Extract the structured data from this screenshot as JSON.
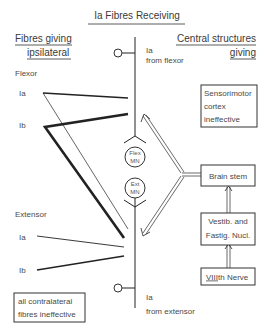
{
  "title": "Ia Fibres Receiving",
  "left_heading": {
    "line1": "Fibres giving",
    "line2": "ipsilateral"
  },
  "right_heading": {
    "line1": "Central structures",
    "line2": "giving"
  },
  "flexor_group": {
    "label": "Flexor",
    "ia": "Ia",
    "ib": "Ib"
  },
  "extensor_group": {
    "label": "Extensor",
    "ia": "Ia",
    "ib": "Ib"
  },
  "top_input": {
    "line1": "Ia",
    "line2": "from flexor"
  },
  "bottom_input": {
    "line1": "Ia",
    "line2": "from extensor"
  },
  "neurons": {
    "flex": {
      "line1": "Flex",
      "line2": "MN"
    },
    "ext": {
      "line1": "Ext",
      "line2": "MN"
    }
  },
  "boxes": {
    "sensorimotor": {
      "line1": "Sensorimotor",
      "line2": "cortex",
      "line3": "ineffective"
    },
    "brain_stem": {
      "label": "Brain stem"
    },
    "vestib": {
      "line1": "Vestib. and",
      "line2": "Fastig. Nucl."
    },
    "eighth_nerve": {
      "roman": "VIII",
      "suffix": "th Nerve"
    },
    "contralateral": {
      "line1": "all contralateral",
      "line2": "fibres ineffective"
    }
  },
  "colors": {
    "ink": "#222222",
    "text": "#3a3a3a",
    "background": "#ffffff"
  }
}
